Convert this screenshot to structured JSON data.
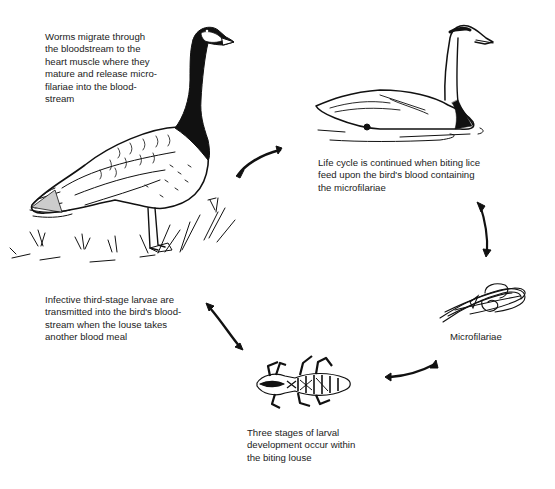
{
  "diagram": {
    "stages": [
      {
        "id": "adult-worms-in-goose",
        "illustration": "canada-goose",
        "caption": "Worms migrate through\nthe bloodstream to the\nheart muscle where they\nmature and release micro-\nfilariae into the blood-\nstream"
      },
      {
        "id": "lice-feeding-on-swan",
        "illustration": "swan",
        "caption": "Life cycle is continued when biting lice\nfeed upon the bird's blood containing\nthe microfilariae"
      },
      {
        "id": "microfilariae",
        "illustration": "microfilariae-worms",
        "caption": "Microfilariae"
      },
      {
        "id": "larval-development-in-louse",
        "illustration": "biting-louse",
        "caption": "Three stages of larval\ndevelopment occur within\nthe biting louse"
      },
      {
        "id": "transmission-to-bird",
        "illustration": "none",
        "caption": "Infective third-stage larvae are\ntransmitted into the bird's blood-\nstream when the louse takes\nanother blood meal"
      }
    ],
    "arrows": [
      {
        "from": "adult-worms-in-goose",
        "to": "lice-feeding-on-swan",
        "direction": "up-right"
      },
      {
        "from": "lice-feeding-on-swan",
        "to": "microfilariae",
        "direction": "down"
      },
      {
        "from": "microfilariae",
        "to": "larval-development-in-louse",
        "direction": "left"
      },
      {
        "from": "larval-development-in-louse",
        "to": "transmission-to-bird",
        "direction": "up-left"
      }
    ],
    "colors": {
      "ink": "#111111",
      "background": "#ffffff"
    }
  }
}
